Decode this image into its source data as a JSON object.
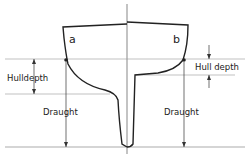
{
  "diagram": {
    "title": "",
    "labels": {
      "section_a": "a",
      "section_b": "b",
      "hull_depth_left": "Hulldepth",
      "hull_depth_right": "Hull depth",
      "draught_left": "Draught",
      "draught_right": "Draught"
    },
    "colors": {
      "line": "#222222",
      "guide": "#888888",
      "background": "#ffffff"
    }
  }
}
